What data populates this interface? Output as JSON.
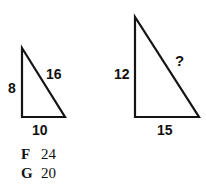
{
  "question": {
    "prompt_symbol": "?",
    "figures": [
      {
        "name": "small-triangle",
        "vertices": {
          "apex": [
            22,
            48
          ],
          "bottom_left": [
            22,
            117
          ],
          "bottom_right": [
            65,
            117
          ]
        },
        "labels": {
          "vertical_leg": "8",
          "hypotenuse": "16",
          "horizontal_leg": "10"
        }
      },
      {
        "name": "large-triangle",
        "vertices": {
          "apex": [
            135,
            17
          ],
          "bottom_left": [
            135,
            117
          ],
          "bottom_right": [
            199,
            117
          ]
        },
        "labels": {
          "vertical_leg": "12",
          "hypotenuse": "?",
          "horizontal_leg": "15"
        }
      }
    ]
  },
  "answers": [
    {
      "letter": "F",
      "value": "24"
    },
    {
      "letter": "G",
      "value": "20"
    }
  ],
  "colors": {
    "ink": "#141414",
    "text": "#111111",
    "background": "#ffffff"
  }
}
